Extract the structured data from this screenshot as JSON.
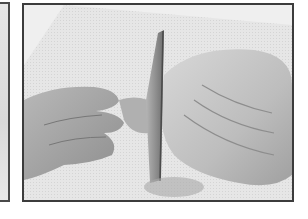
{
  "image": {
    "description": "Grayscale photo: hand holding a raw chicken on a cutting board while a chef's knife cuts through the joint",
    "subjects": [
      "hand",
      "knife",
      "raw-chicken",
      "cutting-board"
    ],
    "palette": {
      "background": "#ffffff",
      "frame": "#3c3c3c",
      "board": "#e2e2e2",
      "chicken": "#c8c8c8",
      "hand": "#a9a9a9",
      "knife": "#8a8a8a"
    }
  }
}
